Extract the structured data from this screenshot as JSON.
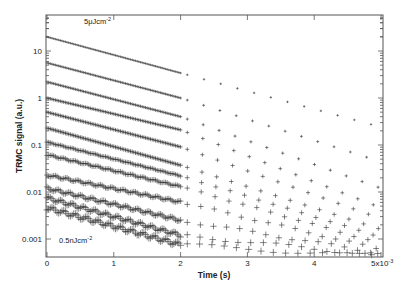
{
  "chart_data": {
    "type": "scatter",
    "title": "",
    "xlabel": "Time (s)",
    "ylabel": "TRMC signal (a.u.)",
    "xscale": "linear",
    "yscale": "log",
    "xlim": [
      0,
      0.005
    ],
    "ylim": [
      0.0004,
      60
    ],
    "x_ticks": [
      0,
      1,
      2,
      3,
      4,
      5
    ],
    "x_tick_labels": [
      "0",
      "1",
      "2",
      "3",
      "4",
      "5x10"
    ],
    "x_tick_multiplier_label": "-3",
    "y_ticks": [
      10,
      1,
      0.1,
      0.01,
      0.001
    ],
    "y_tick_labels": [
      "10",
      "1",
      "0.1",
      "0.01",
      "0.001"
    ],
    "grid": false,
    "legend": null,
    "marker": "+",
    "annotations": [
      {
        "text": "5μJcm",
        "sup": "-2",
        "position": "top-left",
        "refers_to": "highest intensity series"
      },
      {
        "text": "0.5nJcm",
        "sup": "-2",
        "position": "bottom-left",
        "refers_to": "lowest intensity series"
      }
    ],
    "x_ms": [
      0,
      2,
      5
    ],
    "series": [
      {
        "name": "5 μJcm-2",
        "values_at_x_ms": [
          20,
          3.4,
          0.24
        ]
      },
      {
        "name": "series 2",
        "values_at_x_ms": [
          5.6,
          1.0,
          0.044
        ]
      },
      {
        "name": "series 3",
        "values_at_x_ms": [
          2.2,
          0.4,
          0.012
        ]
      },
      {
        "name": "series 4",
        "values_at_x_ms": [
          1.0,
          0.21,
          0.0046
        ]
      },
      {
        "name": "series 5",
        "values_at_x_ms": [
          0.5,
          0.091,
          0.0027
        ]
      },
      {
        "name": "series 6",
        "values_at_x_ms": [
          0.23,
          0.037,
          0.0016
        ]
      },
      {
        "name": "series 7",
        "values_at_x_ms": [
          0.115,
          0.022,
          0.0011
        ]
      },
      {
        "name": "series 8",
        "values_at_x_ms": [
          0.062,
          0.013,
          0.0008
        ]
      },
      {
        "name": "series 9",
        "values_at_x_ms": [
          0.023,
          0.0061,
          0.0006
        ]
      },
      {
        "name": "series 10",
        "values_at_x_ms": [
          0.012,
          0.0025,
          0.0005
        ]
      },
      {
        "name": "series 11",
        "values_at_x_ms": [
          0.0075,
          0.0012,
          0.00045
        ]
      },
      {
        "name": "0.5 nJcm-2",
        "values_at_x_ms": [
          0.0046,
          0.00075,
          0.00042
        ]
      }
    ]
  },
  "labels": {
    "xlabel": "Time (s)",
    "ylabel": "TRMC signal (a.u.)",
    "annot_top": "5μJcm",
    "annot_top_sup": "-2",
    "annot_bottom": "0.5nJcm",
    "annot_bottom_sup": "-2",
    "x_mult_sup": "-3"
  }
}
